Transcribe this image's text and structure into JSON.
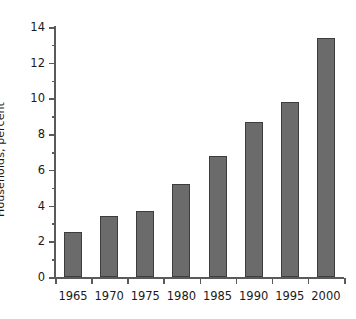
{
  "chart_data": {
    "type": "bar",
    "title": "",
    "subtitle": "",
    "xlabel": "",
    "ylabel": "Households, percent",
    "categories": [
      "1965",
      "1970",
      "1975",
      "1980",
      "1985",
      "1990",
      "1995",
      "2000"
    ],
    "values": [
      2.5,
      3.4,
      3.7,
      5.2,
      6.75,
      8.7,
      9.8,
      13.4
    ],
    "ylim": [
      0,
      14
    ],
    "y_major_ticks": [
      0,
      2,
      4,
      6,
      8,
      10,
      12,
      14
    ],
    "y_minor_ticks": [
      1,
      3,
      5,
      7,
      9,
      11,
      13
    ],
    "y_tick_labels": [
      "0",
      "2",
      "4",
      "6",
      "8",
      "10",
      "12",
      "14"
    ],
    "grid": false,
    "legend": null,
    "legend_position": "none",
    "annotations": [],
    "colors": {
      "bar_fill": "#6b6b6b",
      "bar_edge": "#3d3d3d",
      "axis": "#5a5a5a",
      "text": "#1a1a1a",
      "background": "#ffffff"
    }
  }
}
